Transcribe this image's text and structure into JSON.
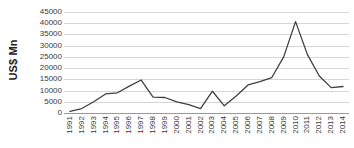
{
  "chart_data": {
    "type": "line",
    "title": "",
    "xlabel": "",
    "ylabel": "US$ Mn",
    "ylim": [
      0,
      45000
    ],
    "ytick_step": 5000,
    "grid": true,
    "legend": "none",
    "line_color": "#404040",
    "grid_color": "#d6d6d6",
    "axis_color": "#9a9a9a",
    "categories": [
      "1991",
      "1992",
      "1993",
      "1994",
      "1995",
      "1996",
      "1997",
      "1998",
      "1999",
      "2000",
      "2001",
      "2002",
      "2003",
      "2004",
      "2005",
      "2006",
      "2007",
      "2008",
      "2009",
      "2010",
      "2011",
      "2012",
      "2013",
      "2014"
    ],
    "yticks": [
      "0",
      "5000",
      "10000",
      "15000",
      "20000",
      "25000",
      "30000",
      "35000",
      "40000",
      "45000"
    ],
    "series": [
      {
        "name": "US$ Mn",
        "values": [
          700,
          2000,
          5000,
          8500,
          9000,
          12000,
          14700,
          7100,
          6900,
          5000,
          3700,
          2000,
          9700,
          3200,
          7600,
          12500,
          14000,
          15800,
          25000,
          40700,
          26000,
          16500,
          11300,
          11800
        ]
      }
    ]
  }
}
